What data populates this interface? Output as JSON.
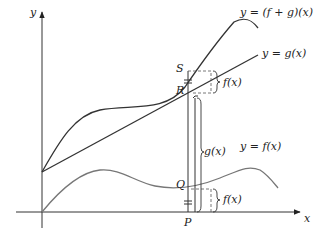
{
  "diagram": {
    "axes": {
      "x_label": "x",
      "y_label": "y"
    },
    "curves": [
      {
        "name": "f-plus-g",
        "label": "y = (f + g)(x)",
        "color": "#333333"
      },
      {
        "name": "g",
        "label": "y = g(x)",
        "color": "#333333"
      },
      {
        "name": "f",
        "label": "y = f(x)",
        "color": "#777777"
      }
    ],
    "points": {
      "S": "S",
      "R": "R",
      "Q": "Q",
      "P": "P"
    },
    "braces": {
      "top": "f(x)",
      "middle": "g(x)",
      "bottom": "f(x)"
    },
    "equal_marks": "="
  }
}
